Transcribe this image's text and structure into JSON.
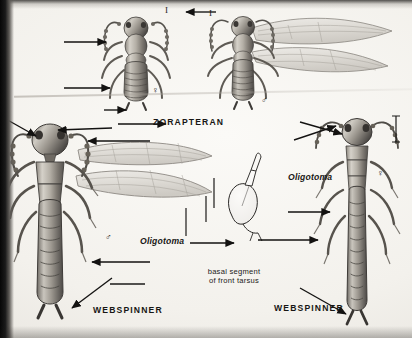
{
  "plate": {
    "title": "Zorapteran and Webspinner comparative plate",
    "medium": "halftone book illustration on aged paper",
    "background_color": "#f4f2ee",
    "ink_color": "#1d1c1a"
  },
  "labels": {
    "zorapteran": "ZORAPTERAN",
    "webspinner_left": "WEBSPINNER",
    "webspinner_right": "WEBSPINNER",
    "oligotoma_left": "Oligotoma",
    "oligotoma_right": "Oligotoma",
    "tarsus_note_line1": "basal segment",
    "tarsus_note_line2": "of front tarsus"
  },
  "symbols": {
    "female": "♀",
    "male": "♂",
    "scale_mark": "I"
  },
  "figures": [
    {
      "id": "zorapteran-female",
      "common_name": "ZORAPTERAN",
      "sex": "♀",
      "winged": false,
      "position": "top-center"
    },
    {
      "id": "zorapteran-male",
      "common_name": "ZORAPTERAN",
      "sex": "♂",
      "winged": true,
      "position": "top-right"
    },
    {
      "id": "webspinner-male",
      "common_name": "WEBSPINNER",
      "genus": "Oligotoma",
      "sex": "♂",
      "winged": true,
      "position": "lower-left"
    },
    {
      "id": "webspinner-female",
      "common_name": "WEBSPINNER",
      "genus": "Oligotoma",
      "sex": "♀",
      "winged": false,
      "position": "lower-right"
    },
    {
      "id": "front-tarsus-detail",
      "caption": "basal segment of front tarsus",
      "line_art": true,
      "position": "lower-center"
    }
  ],
  "scale_bars": [
    {
      "id": "scale-zorapteran-male",
      "orientation": "vertical",
      "glyph": "I"
    },
    {
      "id": "scale-zorapteran-female",
      "orientation": "vertical",
      "glyph": "I"
    },
    {
      "id": "scale-webspinner-male",
      "orientation": "vertical",
      "glyph": "|"
    },
    {
      "id": "scale-webspinner-female",
      "orientation": "vertical",
      "glyph": "|"
    },
    {
      "id": "scale-tarsus",
      "orientation": "vertical",
      "glyph": "|"
    }
  ],
  "leader_arrow_count": 12
}
